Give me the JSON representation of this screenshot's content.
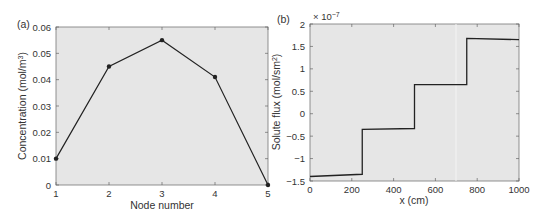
{
  "chart_data": [
    {
      "panel": "(a)",
      "type": "line",
      "title": "",
      "xlabel": "Node number",
      "ylabel": "Concentration (mol/m³)",
      "x": [
        1,
        2,
        3,
        4,
        5
      ],
      "values": [
        0.01,
        0.045,
        0.055,
        0.041,
        0.0
      ],
      "xlim": [
        1,
        5
      ],
      "ylim": [
        0,
        0.06
      ],
      "xticks": [
        "1",
        "2",
        "3",
        "4",
        "5"
      ],
      "yticks": [
        "0",
        "0.01",
        "0.02",
        "0.03",
        "0.04",
        "0.05",
        "0.06"
      ],
      "markers": true,
      "grid": false
    },
    {
      "panel": "(b)",
      "type": "line",
      "title": "",
      "xlabel": "x (cm)",
      "ylabel": "Solute flux (mol/sm²)",
      "y_multiplier": "× 10⁻⁷",
      "x": [
        0,
        250,
        250,
        500,
        500,
        750,
        750,
        1000
      ],
      "values": [
        -1.4,
        -1.35,
        -0.35,
        -0.33,
        0.65,
        0.65,
        1.68,
        1.65
      ],
      "xlim": [
        0,
        1000
      ],
      "ylim": [
        -1.5,
        2
      ],
      "xticks": [
        "0",
        "200",
        "400",
        "600",
        "800",
        "1000"
      ],
      "yticks": [
        "-1.5",
        "-1",
        "-0.5",
        "0",
        "0.5",
        "1",
        "1.5",
        "2"
      ],
      "markers": false,
      "grid": false
    }
  ],
  "panels": {
    "a": {
      "label": "(a)",
      "xlabel": "Node number",
      "ylabel": "Concentration (mol/m",
      "ylabel_sup": "3",
      "ylabel_end": ")"
    },
    "b": {
      "label": "(b)",
      "xlabel": "x (cm)",
      "ylabel": "Solute flux (mol/sm",
      "ylabel_sup": "2",
      "ylabel_end": ")",
      "multiplier": "× 10",
      "multiplier_exp": "−7"
    }
  },
  "colors": {
    "plot_bg": "#e6e6e6",
    "line": "#222222",
    "axis": "#555555"
  }
}
